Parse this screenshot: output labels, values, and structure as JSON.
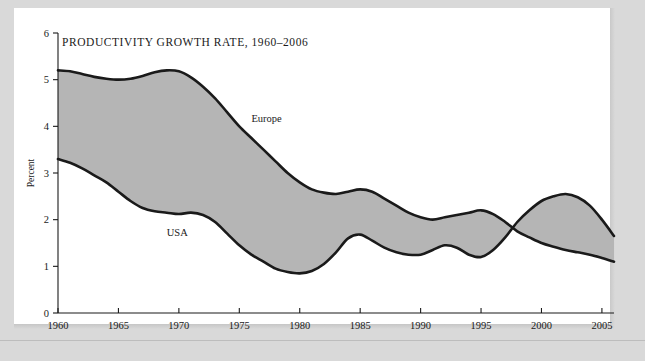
{
  "figure": {
    "title": "PRODUCTIVITY GROWTH RATE, 1960–2006",
    "ylabel": "Percent",
    "series_labels": {
      "europe": "Europe",
      "usa": "USA"
    },
    "band_color": "#b5b5b5",
    "line_color": "#1a1a1a",
    "page_background": "#ffffff",
    "outer_background": "#d9d9d9"
  },
  "chart_data": {
    "type": "area",
    "title": "PRODUCTIVITY GROWTH RATE, 1960–2006",
    "xlabel": "",
    "ylabel": "Percent",
    "xlim": [
      1960,
      2006
    ],
    "ylim": [
      0,
      6
    ],
    "grid": false,
    "legend_position": "inline-annotation",
    "xticks": [
      1960,
      1965,
      1970,
      1975,
      1980,
      1985,
      1990,
      1995,
      2000,
      2005
    ],
    "xticklabels": [
      "1960",
      "1965",
      "1970",
      "1975",
      "1980",
      "1985",
      "1990",
      "1995",
      "2000",
      "2005"
    ],
    "yticks": [
      0,
      1,
      2,
      3,
      4,
      5,
      6
    ],
    "yticklabels": [
      "0",
      "1",
      "2",
      "3",
      "4",
      "5",
      "6"
    ],
    "x": [
      1960,
      1961,
      1962,
      1963,
      1964,
      1965,
      1966,
      1967,
      1968,
      1969,
      1970,
      1971,
      1972,
      1973,
      1974,
      1975,
      1976,
      1977,
      1978,
      1979,
      1980,
      1981,
      1982,
      1983,
      1984,
      1985,
      1986,
      1987,
      1988,
      1989,
      1990,
      1991,
      1992,
      1993,
      1994,
      1995,
      1996,
      1997,
      1998,
      1999,
      2000,
      2001,
      2002,
      2003,
      2004,
      2005,
      2006
    ],
    "series": [
      {
        "name": "Europe",
        "values": [
          5.2,
          5.18,
          5.12,
          5.06,
          5.02,
          5.0,
          5.02,
          5.08,
          5.16,
          5.2,
          5.18,
          5.05,
          4.85,
          4.6,
          4.3,
          4.0,
          3.75,
          3.5,
          3.25,
          3.0,
          2.8,
          2.65,
          2.58,
          2.55,
          2.6,
          2.65,
          2.6,
          2.45,
          2.3,
          2.15,
          2.05,
          2.0,
          2.05,
          2.1,
          2.15,
          2.2,
          2.12,
          1.95,
          1.75,
          1.62,
          1.5,
          1.42,
          1.35,
          1.3,
          1.25,
          1.18,
          1.1
        ]
      },
      {
        "name": "USA",
        "values": [
          3.3,
          3.22,
          3.1,
          2.95,
          2.8,
          2.6,
          2.4,
          2.25,
          2.18,
          2.15,
          2.12,
          2.15,
          2.1,
          1.95,
          1.7,
          1.45,
          1.25,
          1.1,
          0.95,
          0.88,
          0.85,
          0.9,
          1.05,
          1.3,
          1.6,
          1.68,
          1.55,
          1.4,
          1.3,
          1.25,
          1.25,
          1.35,
          1.45,
          1.4,
          1.25,
          1.2,
          1.35,
          1.62,
          1.95,
          2.2,
          2.4,
          2.5,
          2.55,
          2.48,
          2.3,
          2.0,
          1.65
        ]
      }
    ],
    "annotations": [
      {
        "text": "Europe",
        "x": 1976,
        "y": 4.1
      },
      {
        "text": "USA",
        "x": 1969,
        "y": 1.65
      }
    ]
  }
}
